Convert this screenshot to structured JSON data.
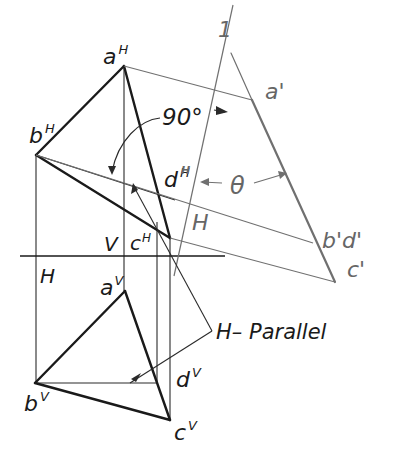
{
  "diagram": {
    "type": "descriptive-geometry-auxiliary-view",
    "colors": {
      "object_line": "#1a1a1a",
      "projection_line": "#2a2a2a",
      "auxiliary_line": "#707070",
      "background": "#ffffff"
    },
    "labels": {
      "aH": {
        "base": "a",
        "sup": "H"
      },
      "bH": {
        "base": "b",
        "sup": "H"
      },
      "cH": {
        "base": "c",
        "sup": "H"
      },
      "dH": {
        "base": "d",
        "sup": "H"
      },
      "aV": {
        "base": "a",
        "sup": "V"
      },
      "bV": {
        "base": "b",
        "sup": "V"
      },
      "cV": {
        "base": "c",
        "sup": "V"
      },
      "dV": {
        "base": "d",
        "sup": "V"
      },
      "a1": "a'",
      "b1d1": "b'd'",
      "c1": "c'",
      "angle_90": "90°",
      "theta": "θ",
      "fold_H_left": "H",
      "fold_V_left": "V",
      "fold_H_aux": "H",
      "fold_1_aux": "1",
      "fold_H_small": "H",
      "h_parallel": "H– Parallel"
    }
  }
}
